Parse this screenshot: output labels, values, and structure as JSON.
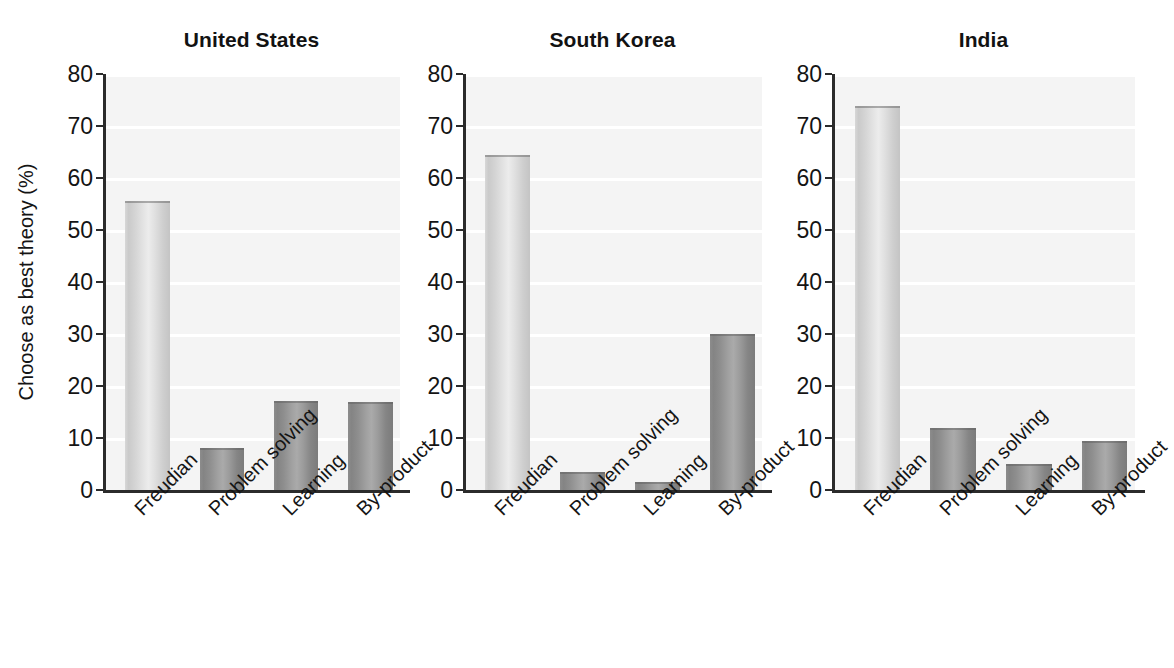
{
  "chart_data": {
    "type": "bar",
    "title": "",
    "xlabel": "",
    "ylabel": "Choose as best theory (%)",
    "ylim": [
      0,
      80
    ],
    "ytick_labels": [
      "0",
      "10",
      "20",
      "30",
      "40",
      "50",
      "60",
      "70",
      "80"
    ],
    "ytick_values": [
      0,
      10,
      20,
      30,
      40,
      50,
      60,
      70,
      80
    ],
    "grid": "horizontal-only",
    "legend": "none",
    "categories": [
      "Freudian",
      "Problem solving",
      "Learning",
      "By-product"
    ],
    "panels": [
      {
        "title": "United States",
        "values": [
          55.6,
          8.1,
          17.2,
          17.0
        ]
      },
      {
        "title": "South Korea",
        "values": [
          64.5,
          3.4,
          1.5,
          30.0
        ]
      },
      {
        "title": "India",
        "values": [
          73.8,
          11.9,
          5.0,
          9.5
        ]
      }
    ],
    "series": [
      {
        "name": "United States",
        "values": [
          55.6,
          8.1,
          17.2,
          17.0
        ]
      },
      {
        "name": "South Korea",
        "values": [
          64.5,
          3.4,
          1.5,
          30.0
        ]
      },
      {
        "name": "India",
        "values": [
          73.8,
          11.9,
          5.0,
          9.5
        ]
      }
    ],
    "bar_styles": [
      "light",
      "dark",
      "dark",
      "dark"
    ],
    "colors": {
      "bar_light": "#dcdcdc",
      "bar_dark": "#969696",
      "plot_background": "#f4f4f4",
      "gridline": "#ffffff",
      "axis": "#2b2b2b",
      "text": "#141414"
    }
  }
}
